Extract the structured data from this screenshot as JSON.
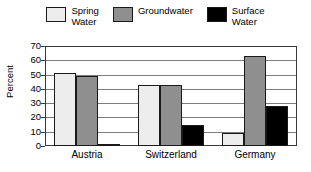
{
  "chart_data": {
    "type": "bar",
    "title": "",
    "xlabel": "",
    "ylabel": "Percent",
    "ylim": [
      0,
      70
    ],
    "yticks": [
      0,
      10,
      20,
      30,
      40,
      50,
      60,
      70
    ],
    "grid": true,
    "legend_position": "top",
    "categories": [
      "Austria",
      "Switzerland",
      "Germany"
    ],
    "series": [
      {
        "name": "Spring Water",
        "legend_label": "Spring\nWater",
        "color": "#ededed",
        "values": [
          51,
          43,
          9
        ]
      },
      {
        "name": "Groundwater",
        "legend_label": "Groundwater",
        "color": "#8f8f8f",
        "values": [
          49,
          43,
          63
        ]
      },
      {
        "name": "Surface Water",
        "legend_label": "Surface\nWater",
        "color": "#000000",
        "values": [
          1,
          15,
          28
        ]
      }
    ]
  },
  "axis": {
    "y_title": "Percent"
  },
  "colors": {
    "background": "#ffffff",
    "frame": "#3a3a3a",
    "gridline": "#7d7d7d",
    "bar_outline": "#1a1a1a",
    "text": "#000000"
  }
}
